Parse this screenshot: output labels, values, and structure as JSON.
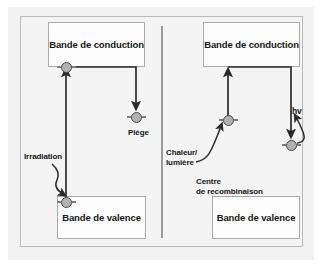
{
  "figure": {
    "title": "",
    "panels": [
      {
        "id": "left",
        "name": "irradiation-trapping",
        "conduction_band": "Bande\nde conduction",
        "valence_band": "Bande\nde valence",
        "labels": [
          {
            "name": "piege",
            "text": "Piège"
          },
          {
            "name": "irradiation",
            "text": "Irradiation"
          }
        ]
      },
      {
        "id": "right",
        "name": "recombination",
        "conduction_band": "Bande\nde conduction",
        "valence_band": "Bande\nde valence",
        "labels": [
          {
            "name": "chaleur-lumiere",
            "text": "Chaleur/\nlumière"
          },
          {
            "name": "centre-recombinaison",
            "text": "Centre\nde recombinaison"
          },
          {
            "name": "hv",
            "text": "hv"
          }
        ]
      }
    ],
    "colors": {
      "background": "#f2f2f2",
      "panel_background": "#f4f4f4",
      "box_fill": "#fdfdfd",
      "box_border": "#aaaaaa",
      "frame_border": "#b9b9b9",
      "divider": "#9a9a9a",
      "arrow": "#2b2b2b",
      "node_fill": "#b2b2b2",
      "node_border": "#4a4a4a",
      "text": "#141414"
    }
  }
}
